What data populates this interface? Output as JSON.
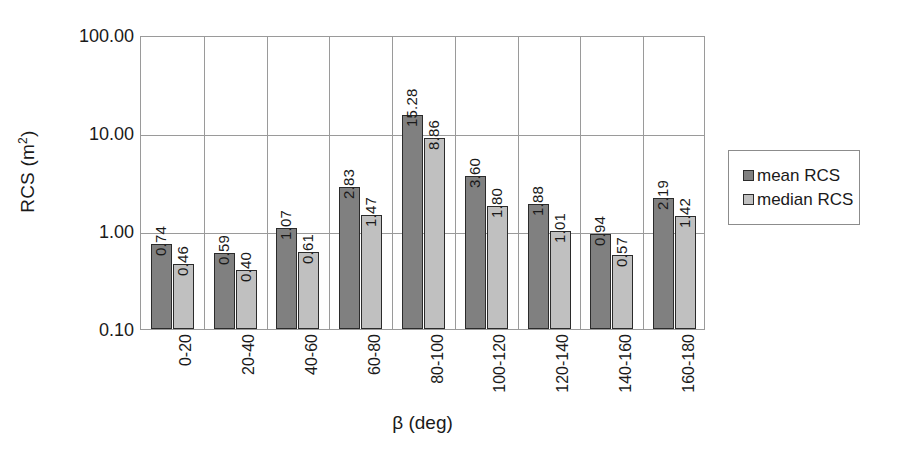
{
  "chart_data": {
    "type": "bar",
    "title": "",
    "xlabel": "β (deg)",
    "ylabel": "RCS (m²)",
    "yscale": "log",
    "ylim": [
      0.1,
      100.0
    ],
    "ytick_labels": [
      "100.00",
      "10.00",
      "1.00",
      "0.10"
    ],
    "ytick_values": [
      100.0,
      10.0,
      1.0,
      0.1
    ],
    "grid": true,
    "legend_position": "right",
    "categories": [
      "0-20",
      "20-40",
      "40-60",
      "60-80",
      "80-100",
      "100-120",
      "120-140",
      "140-160",
      "160-180"
    ],
    "series": [
      {
        "name": "mean RCS",
        "color": "#808080",
        "values": [
          0.74,
          0.59,
          1.07,
          2.83,
          15.28,
          3.6,
          1.88,
          0.94,
          2.19
        ],
        "labels": [
          "0.74",
          "0.59",
          "1.07",
          "2.83",
          "15.28",
          "3.60",
          "1.88",
          "0.94",
          "2.19"
        ]
      },
      {
        "name": "median RCS",
        "color": "#c0c0c0",
        "values": [
          0.46,
          0.4,
          0.61,
          1.47,
          8.86,
          1.8,
          1.01,
          0.57,
          1.42
        ],
        "labels": [
          "0.46",
          "0.40",
          "0.61",
          "1.47",
          "8.86",
          "1.80",
          "1.01",
          "0.57",
          "1.42"
        ]
      }
    ]
  },
  "legend": {
    "entries": [
      {
        "label": "mean RCS",
        "color": "#808080"
      },
      {
        "label": "median RCS",
        "color": "#c0c0c0"
      }
    ]
  }
}
